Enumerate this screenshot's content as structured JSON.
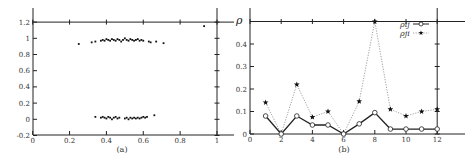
{
  "chart_data": [
    {
      "type": "scatter",
      "panel": "a",
      "caption": "(a)",
      "title": "",
      "xlabel": "",
      "ylabel": "",
      "xlim": [
        0,
        1.1
      ],
      "ylim": [
        -0.2,
        1.2
      ],
      "x_ticks": [
        0,
        0.2,
        0.4,
        0.6,
        0.8,
        1
      ],
      "x_tick_labels": [
        "0",
        "0.2",
        "0.4",
        "0.6",
        "0.8",
        "1"
      ],
      "y_ticks": [
        -0.2,
        0,
        0.2,
        0.4,
        0.6,
        0.8,
        1,
        1.2
      ],
      "y_tick_labels": [
        "-0.2",
        "0",
        "0.2",
        "0.4",
        "0.6",
        "0.8",
        "1",
        "1.2"
      ],
      "grid": false,
      "series": [
        {
          "name": "upper cluster",
          "points": [
            [
              0.25,
              0.93
            ],
            [
              0.32,
              0.95
            ],
            [
              0.34,
              0.96
            ],
            [
              0.37,
              0.97
            ],
            [
              0.38,
              0.98
            ],
            [
              0.39,
              0.97
            ],
            [
              0.4,
              0.99
            ],
            [
              0.41,
              0.98
            ],
            [
              0.42,
              0.97
            ],
            [
              0.43,
              0.99
            ],
            [
              0.44,
              0.98
            ],
            [
              0.45,
              0.97
            ],
            [
              0.46,
              0.99
            ],
            [
              0.47,
              0.98
            ],
            [
              0.48,
              0.96
            ],
            [
              0.49,
              0.98
            ],
            [
              0.5,
              1.0
            ],
            [
              0.51,
              0.98
            ],
            [
              0.52,
              0.97
            ],
            [
              0.53,
              0.99
            ],
            [
              0.54,
              0.98
            ],
            [
              0.55,
              0.97
            ],
            [
              0.56,
              0.98
            ],
            [
              0.57,
              0.99
            ],
            [
              0.58,
              0.97
            ],
            [
              0.59,
              0.98
            ],
            [
              0.6,
              0.97
            ],
            [
              0.63,
              0.96
            ],
            [
              0.64,
              0.95
            ],
            [
              0.67,
              0.96
            ],
            [
              0.71,
              0.94
            ]
          ]
        },
        {
          "name": "lower cluster",
          "points": [
            [
              0.34,
              0.03
            ],
            [
              0.37,
              0.02
            ],
            [
              0.38,
              0.03
            ],
            [
              0.39,
              0.02
            ],
            [
              0.4,
              0.01
            ],
            [
              0.41,
              0.03
            ],
            [
              0.42,
              0.02
            ],
            [
              0.43,
              0.0
            ],
            [
              0.44,
              0.02
            ],
            [
              0.45,
              0.03
            ],
            [
              0.46,
              0.01
            ],
            [
              0.47,
              0.02
            ],
            [
              0.5,
              0.01
            ],
            [
              0.51,
              0.02
            ],
            [
              0.52,
              0.0
            ],
            [
              0.53,
              0.02
            ],
            [
              0.54,
              0.01
            ],
            [
              0.55,
              0.02
            ],
            [
              0.56,
              0.01
            ],
            [
              0.57,
              0.02
            ],
            [
              0.58,
              0.01
            ],
            [
              0.59,
              0.02
            ],
            [
              0.6,
              0.03
            ],
            [
              0.61,
              0.02
            ],
            [
              0.62,
              0.03
            ],
            [
              0.66,
              0.05
            ]
          ]
        },
        {
          "name": "outlier",
          "points": [
            [
              0.93,
              1.15
            ]
          ]
        }
      ]
    },
    {
      "type": "line",
      "panel": "b",
      "caption": "(b)",
      "title": "",
      "xlabel": "",
      "ylabel": "ρ",
      "xlim": [
        0,
        13.5
      ],
      "ylim": [
        0,
        0.5
      ],
      "x_ticks": [
        0,
        2,
        4,
        6,
        8,
        10,
        12
      ],
      "x_tick_labels": [
        "0",
        "2",
        "4",
        "6",
        "8",
        "10",
        "12"
      ],
      "y_ticks": [
        0,
        0.1,
        0.2,
        0.3,
        0.4
      ],
      "y_tick_labels": [
        "0",
        "0.1",
        "0.2",
        "0.3",
        "0.4"
      ],
      "grid": false,
      "legend_position": "top-right",
      "x": [
        1,
        2,
        3,
        4,
        5,
        6,
        7,
        8,
        9,
        10,
        11,
        12
      ],
      "series": [
        {
          "name": "ρij",
          "marker": "circle",
          "linestyle": "solid",
          "values": [
            0.08,
            0.0,
            0.08,
            0.04,
            0.04,
            0.0,
            0.045,
            0.095,
            0.022,
            0.022,
            0.022,
            0.022
          ]
        },
        {
          "name": "ρji",
          "marker": "star",
          "linestyle": "dotted",
          "values": [
            0.14,
            0.0,
            0.22,
            0.075,
            0.1,
            0.0,
            0.145,
            0.5,
            0.11,
            0.08,
            0.1,
            0.11
          ]
        }
      ]
    }
  ],
  "legend": {
    "entries": [
      {
        "label": "ρij",
        "marker": "circle",
        "line": "solid"
      },
      {
        "label": "ρji",
        "marker": "star",
        "line": "dotted"
      }
    ]
  },
  "colors": {
    "axis": "#222222",
    "marker": "#111111",
    "dotted_line": "#888888",
    "text": "#333333"
  }
}
